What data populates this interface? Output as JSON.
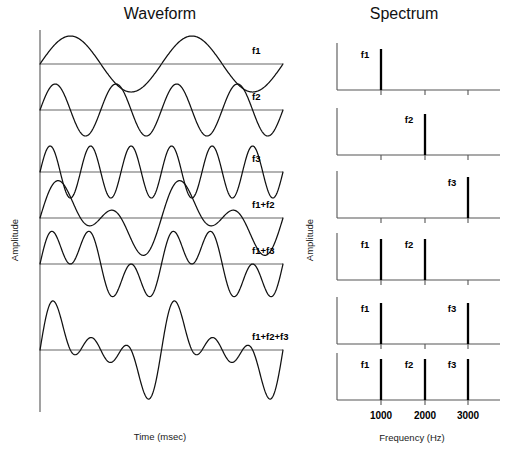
{
  "figure": {
    "width": 508,
    "height": 460,
    "background": "#ffffff",
    "line_color": "#111111",
    "axis_color": "#555555"
  },
  "panels": {
    "waveform": {
      "title": "Waveform",
      "ylabel": "Amplitude",
      "xlabel": "Time (msec)"
    },
    "spectrum": {
      "title": "Spectrum",
      "ylabel": "Amplitude",
      "xlabel": "Frequency (Hz)"
    }
  },
  "chart_data": {
    "type": "line",
    "waveform_panel": {
      "title": "Waveform",
      "xlabel": "Time (msec)",
      "ylabel": "Amplitude",
      "grid": false,
      "xlim": [
        0,
        4
      ],
      "ticks": []
    },
    "spectrum_panel": {
      "title": "Spectrum",
      "xlabel": "Frequency (Hz)",
      "ylabel": "Amplitude",
      "grid": false,
      "xlim": [
        0,
        4000
      ],
      "tick_values": [
        1000,
        2000,
        3000
      ],
      "tick_labels": [
        "1000",
        "2000",
        "3000"
      ]
    },
    "components": [
      {
        "name": "f1",
        "frequency_hz": 1000,
        "cycles_shown": 2,
        "amplitude": 1
      },
      {
        "name": "f2",
        "frequency_hz": 2000,
        "cycles_shown": 4,
        "amplitude": 1
      },
      {
        "name": "f3",
        "frequency_hz": 3000,
        "cycles_shown": 6,
        "amplitude": 1
      }
    ],
    "rows": [
      {
        "label": "f1",
        "components": [
          "f1"
        ],
        "cycles": [
          2
        ],
        "peaks": [
          {
            "label": "f1",
            "frequency_hz": 1000,
            "amplitude": 1
          }
        ]
      },
      {
        "label": "f2",
        "components": [
          "f2"
        ],
        "cycles": [
          4
        ],
        "peaks": [
          {
            "label": "f2",
            "frequency_hz": 2000,
            "amplitude": 1
          }
        ]
      },
      {
        "label": "f3",
        "components": [
          "f3"
        ],
        "cycles": [
          6
        ],
        "peaks": [
          {
            "label": "f3",
            "frequency_hz": 3000,
            "amplitude": 1
          }
        ]
      },
      {
        "label": "f1+f2",
        "components": [
          "f1",
          "f2"
        ],
        "cycles": [
          2,
          4
        ],
        "peaks": [
          {
            "label": "f1",
            "frequency_hz": 1000,
            "amplitude": 1
          },
          {
            "label": "f2",
            "frequency_hz": 2000,
            "amplitude": 1
          }
        ]
      },
      {
        "label": "f1+f3",
        "components": [
          "f1",
          "f3"
        ],
        "cycles": [
          2,
          6
        ],
        "peaks": [
          {
            "label": "f1",
            "frequency_hz": 1000,
            "amplitude": 1
          },
          {
            "label": "f3",
            "frequency_hz": 3000,
            "amplitude": 1
          }
        ]
      },
      {
        "label": "f1+f2+f3",
        "components": [
          "f1",
          "f2",
          "f3"
        ],
        "cycles": [
          2,
          4,
          6
        ],
        "peaks": [
          {
            "label": "f1",
            "frequency_hz": 1000,
            "amplitude": 1
          },
          {
            "label": "f2",
            "frequency_hz": 2000,
            "amplitude": 1
          },
          {
            "label": "f3",
            "frequency_hz": 3000,
            "amplitude": 1
          }
        ]
      }
    ]
  },
  "layout": {
    "wave": {
      "axis_x": 40,
      "plot_right": 283,
      "label_x": 252,
      "top": 30,
      "bottom": 412,
      "row_baselines": [
        64,
        110,
        172,
        218,
        264,
        350
      ],
      "row_amplitudes": [
        28,
        26,
        26,
        30,
        30,
        34
      ],
      "title_x": 160,
      "title_y": 19,
      "ylabel_x": 18,
      "ylabel_y": 240,
      "xlabel_x": 160,
      "xlabel_y": 440
    },
    "spec": {
      "axis_x": 337,
      "plot_right": 500,
      "freq_x": {
        "1000": 381,
        "2000": 425,
        "3000": 468
      },
      "panel_baselines": [
        90,
        155,
        218,
        280,
        344,
        400
      ],
      "panel_top_offset": 47,
      "line_height": 41,
      "title_x": 404,
      "title_y": 19,
      "ylabel_x": 313,
      "ylabel_y": 240,
      "xlabel_x": 412,
      "xlabel_y": 441,
      "tick_label_y": 419,
      "tick_size": 5
    }
  }
}
